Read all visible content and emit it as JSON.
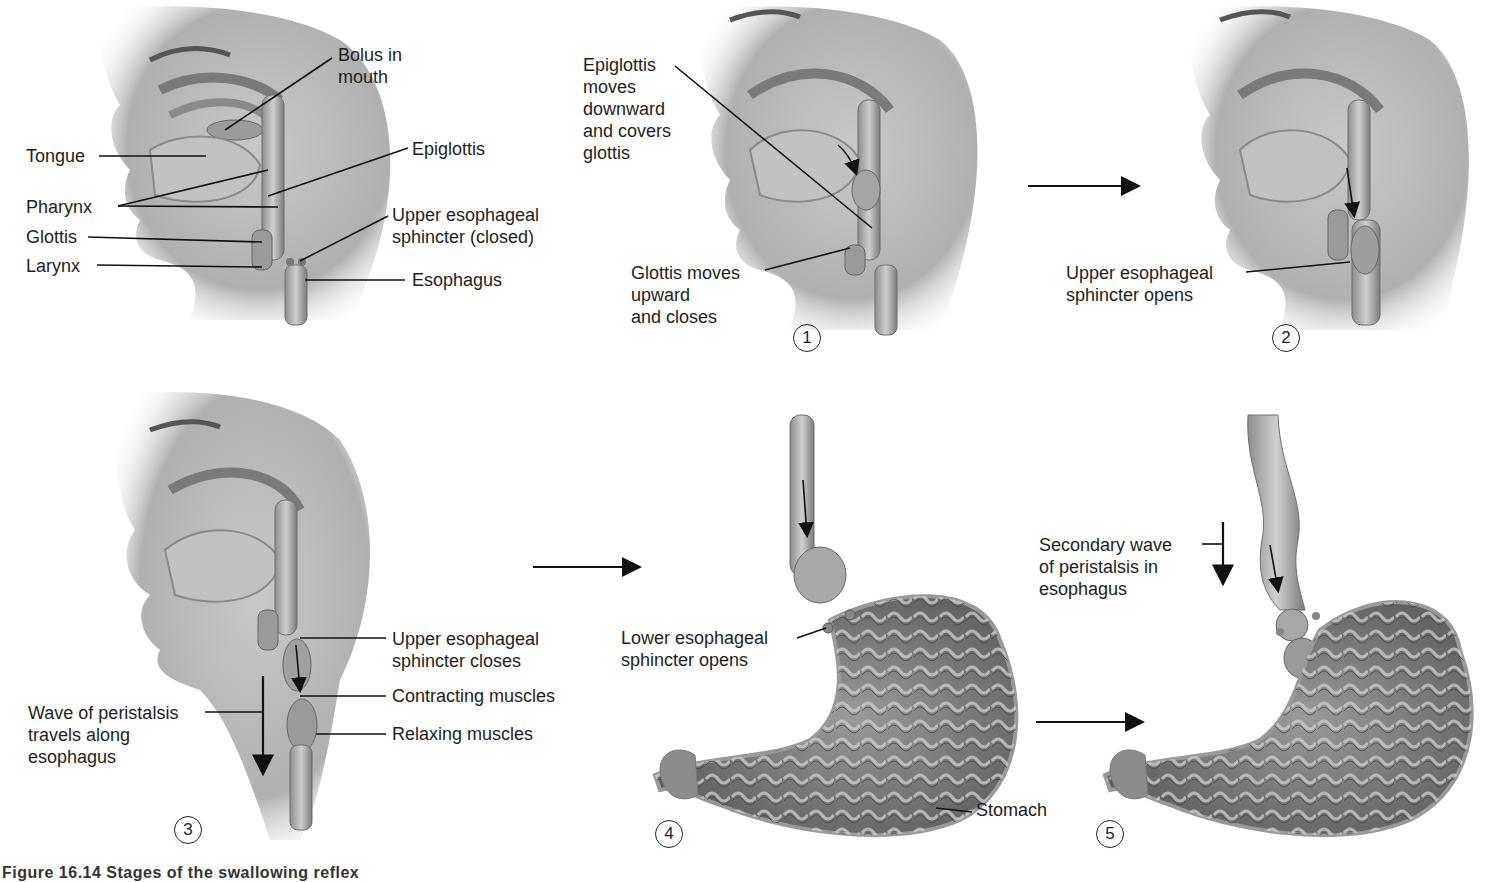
{
  "figure": {
    "caption_partial": "Figure 16.14 Stages of the swallowing reflex"
  },
  "panels": [
    {
      "id": "overview",
      "labels": {
        "bolus": "Bolus in\nmouth",
        "tongue": "Tongue",
        "epiglottis": "Epiglottis",
        "pharynx": "Pharynx",
        "ues": "Upper esophageal\nsphincter (closed)",
        "glottis": "Glottis",
        "larynx": "Larynx",
        "esophagus": "Esophagus"
      }
    },
    {
      "id": "step1",
      "number": "1",
      "labels": {
        "epiglottis": "Epiglottis\nmoves\ndownward\nand covers\nglottis",
        "glottis": "Glottis moves\nupward\nand closes"
      }
    },
    {
      "id": "step2",
      "number": "2",
      "labels": {
        "ues": "Upper esophageal\nsphincter opens"
      }
    },
    {
      "id": "step3",
      "number": "3",
      "labels": {
        "ues": "Upper esophageal\nsphincter closes",
        "contracting": "Contracting muscles",
        "relaxing": "Relaxing muscles",
        "wave": "Wave of peristalsis\ntravels along\nesophagus"
      }
    },
    {
      "id": "step4",
      "number": "4",
      "labels": {
        "les": "Lower esophageal\nsphincter opens",
        "stomach": "Stomach"
      }
    },
    {
      "id": "step5",
      "number": "5",
      "labels": {
        "secondary": "Secondary wave\nof peristalsis in\nesophagus"
      }
    }
  ],
  "colors": {
    "skin_light": "#d9d9d9",
    "skin_mid": "#a8a8a8",
    "skin_dark": "#6e6e6e",
    "line": "#111111",
    "stomach_fill": "#8a8a8a"
  }
}
